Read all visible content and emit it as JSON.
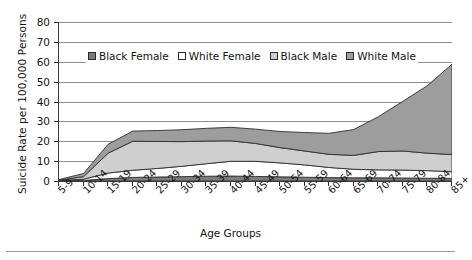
{
  "chart_data": {
    "type": "area",
    "title": "",
    "subtitle": "",
    "xlabel": "Age Groups",
    "ylabel": "Suicide Rate per 100,000 Persons",
    "stacked": true,
    "grid": true,
    "legend_position": "top-inside",
    "ylim": [
      0,
      80
    ],
    "ytick_labels": [
      "0",
      "10",
      "20",
      "30",
      "40",
      "50",
      "60",
      "70",
      "80"
    ],
    "ytick_values": [
      0,
      10,
      20,
      30,
      40,
      50,
      60,
      70,
      80
    ],
    "categories": [
      "5-9",
      "10-14",
      "15-19",
      "20-24",
      "25-29",
      "30-34",
      "35-39",
      "40-44",
      "45-49",
      "50-54",
      "55-59",
      "60-64",
      "65-69",
      "70-74",
      "75-79",
      "80-84",
      "85+"
    ],
    "series": [
      {
        "name": "Black Female",
        "color": "#7d7d7d",
        "values": [
          0.1,
          0.3,
          1.2,
          1.8,
          2.0,
          2.2,
          2.4,
          2.5,
          2.3,
          2.1,
          1.9,
          1.7,
          1.6,
          1.6,
          1.5,
          1.4,
          1.3
        ]
      },
      {
        "name": "White Female",
        "color": "#ffffff",
        "values": [
          0.1,
          0.6,
          2.8,
          3.6,
          4.3,
          5.2,
          6.3,
          7.4,
          7.6,
          7.0,
          6.2,
          5.1,
          4.3,
          4.0,
          4.0,
          3.8,
          3.4
        ]
      },
      {
        "name": "Black Male",
        "color": "#cfcfcf",
        "values": [
          0.2,
          1.3,
          10.0,
          14.6,
          13.6,
          12.4,
          11.4,
          10.3,
          9.0,
          7.7,
          7.0,
          6.6,
          7.0,
          9.2,
          9.6,
          8.8,
          8.6
        ]
      },
      {
        "name": "White Male",
        "color": "#9d9d9d",
        "values": [
          0.3,
          1.6,
          4.5,
          5.1,
          5.5,
          6.0,
          6.4,
          6.8,
          7.2,
          8.1,
          9.3,
          10.6,
          13.0,
          17.5,
          25.0,
          34.0,
          45.5
        ]
      }
    ],
    "series_totals": [
      0.7,
      3.8,
      18.5,
      25.1,
      25.4,
      25.8,
      26.5,
      27.0,
      26.1,
      24.9,
      24.4,
      24.0,
      25.9,
      32.3,
      40.1,
      48.0,
      58.8
    ]
  },
  "legend": {
    "items": [
      {
        "label": "Black Female",
        "swatch": "#7d7d7d"
      },
      {
        "label": "White Female",
        "swatch": "#ffffff"
      },
      {
        "label": "Black Male",
        "swatch": "#cfcfcf"
      },
      {
        "label": "White Male",
        "swatch": "#9d9d9d"
      }
    ]
  },
  "axes": {
    "y_title": "Suicide Rate per 100,000 Persons",
    "x_title": "Age Groups"
  }
}
